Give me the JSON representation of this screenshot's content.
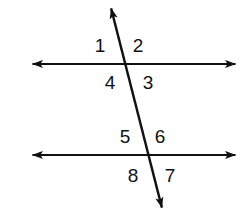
{
  "figure": {
    "background_color": "#ffffff",
    "stroke_color": "#111111",
    "canvas": {
      "width": 242,
      "height": 216
    },
    "lines": [
      {
        "name": "upper-parallel-line",
        "orientation": "horizontal",
        "x1": 28,
        "y1": 64,
        "x2": 240,
        "y2": 64,
        "arrows": "both"
      },
      {
        "name": "lower-parallel-line",
        "orientation": "horizontal",
        "x1": 28,
        "y1": 155,
        "x2": 240,
        "y2": 155,
        "arrows": "both"
      },
      {
        "name": "transversal-line",
        "orientation": "oblique",
        "x1": 110,
        "y1": 4,
        "x2": 163,
        "y2": 212,
        "arrows": "both"
      }
    ],
    "intersections": [
      {
        "name": "upper-intersection",
        "x": 126,
        "y": 64
      },
      {
        "name": "lower-intersection",
        "x": 149,
        "y": 155
      }
    ],
    "angle_labels": [
      {
        "id": "1",
        "text": "1",
        "x": 100,
        "y": 45,
        "position": "upper-left"
      },
      {
        "id": "2",
        "text": "2",
        "x": 138,
        "y": 45,
        "position": "upper-right"
      },
      {
        "id": "3",
        "text": "3",
        "x": 148,
        "y": 82,
        "position": "lower-right"
      },
      {
        "id": "4",
        "text": "4",
        "x": 110,
        "y": 82,
        "position": "lower-left"
      },
      {
        "id": "5",
        "text": "5",
        "x": 125,
        "y": 136,
        "position": "upper-left"
      },
      {
        "id": "6",
        "text": "6",
        "x": 160,
        "y": 136,
        "position": "upper-right"
      },
      {
        "id": "7",
        "text": "7",
        "x": 170,
        "y": 175,
        "position": "lower-right"
      },
      {
        "id": "8",
        "text": "8",
        "x": 133,
        "y": 175,
        "position": "lower-left"
      }
    ]
  }
}
